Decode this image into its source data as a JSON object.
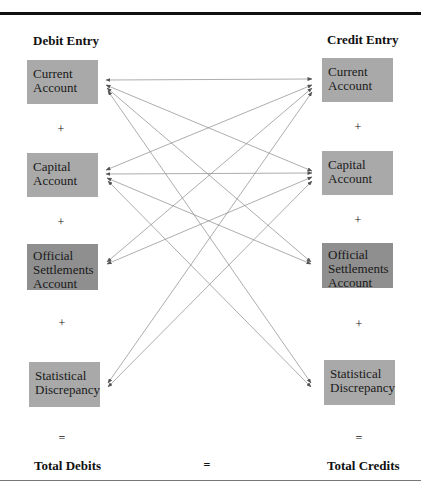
{
  "headings": {
    "debit": "Debit Entry",
    "credit": "Credit Entry"
  },
  "debit_boxes": [
    {
      "label": "Current Account"
    },
    {
      "label": "Capital Account"
    },
    {
      "label": "Official Settlements Account"
    },
    {
      "label": "Statistical Discrepancy"
    }
  ],
  "credit_boxes": [
    {
      "label": "Current Account"
    },
    {
      "label": "Capital Account"
    },
    {
      "label": "Official Settlements Account"
    },
    {
      "label": "Statistical Discrepancy"
    }
  ],
  "operators": {
    "plus": "+",
    "equals": "="
  },
  "totals": {
    "debits": "Total Debits",
    "equals": "=",
    "credits": "Total Credits"
  },
  "connections": [
    {
      "from": "debit.Current Account",
      "to": "credit.Current Account"
    },
    {
      "from": "debit.Current Account",
      "to": "credit.Capital Account"
    },
    {
      "from": "debit.Current Account",
      "to": "credit.Official Settlements Account"
    },
    {
      "from": "debit.Current Account",
      "to": "credit.Statistical Discrepancy"
    },
    {
      "from": "debit.Capital Account",
      "to": "credit.Current Account"
    },
    {
      "from": "debit.Capital Account",
      "to": "credit.Capital Account"
    },
    {
      "from": "debit.Capital Account",
      "to": "credit.Official Settlements Account"
    },
    {
      "from": "debit.Capital Account",
      "to": "credit.Statistical Discrepancy"
    },
    {
      "from": "debit.Official Settlements Account",
      "to": "credit.Current Account"
    },
    {
      "from": "debit.Official Settlements Account",
      "to": "credit.Capital Account"
    },
    {
      "from": "debit.Statistical Discrepancy",
      "to": "credit.Current Account"
    },
    {
      "from": "debit.Statistical Discrepancy",
      "to": "credit.Capital Account"
    }
  ],
  "colors": {
    "box": "#a9a9a9",
    "box_dark": "#8f8f8f",
    "arrow": "#777777",
    "rule": "#111111"
  }
}
